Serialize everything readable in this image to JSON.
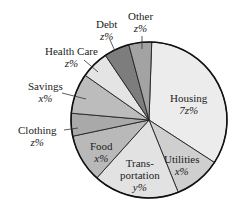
{
  "chart_data": {
    "type": "pie",
    "title": "",
    "center": [
      149,
      120
    ],
    "radius": 78,
    "slices": [
      {
        "name": "Housing",
        "label": "Housing",
        "value_label": "7z%",
        "start": 2,
        "end": 123,
        "color": "#ececec"
      },
      {
        "name": "Utilities",
        "label": "Utilities",
        "value_label": "x%",
        "start": 123,
        "end": 158,
        "color": "#cfcfcf"
      },
      {
        "name": "Transportation",
        "label": "Trans-portation",
        "value_label": "y%",
        "start": 158,
        "end": 222,
        "color": "#e2e2e2"
      },
      {
        "name": "Food",
        "label": "Food",
        "value_label": "x%",
        "start": 222,
        "end": 258,
        "color": "#b9b9b9"
      },
      {
        "name": "Clothing",
        "label": "Clothing",
        "value_label": "z%",
        "start": 258,
        "end": 275,
        "color": "#a9a9a9"
      },
      {
        "name": "Savings",
        "label": "Savings",
        "value_label": "x%",
        "start": 275,
        "end": 305,
        "color": "#bcbcbc"
      },
      {
        "name": "Health Care",
        "label": "Health Care",
        "value_label": "z%",
        "start": 305,
        "end": 326,
        "color": "#e4e4e4"
      },
      {
        "name": "Debt",
        "label": "Debt",
        "value_label": "z%",
        "start": 326,
        "end": 345,
        "color": "#7d7d7d"
      },
      {
        "name": "Other",
        "label": "Other",
        "value_label": "z%",
        "start": 345,
        "end": 362,
        "color": "#a3a3a3"
      }
    ],
    "legend": "none (labels placed on/around slices)"
  },
  "labels": {
    "housing": {
      "name": "Housing",
      "value": "7z%"
    },
    "utilities": {
      "name": "Utilities",
      "value": "x%"
    },
    "transport": {
      "line1": "Trans-",
      "line2": "portation",
      "value": "y%"
    },
    "food": {
      "name": "Food",
      "value": "x%"
    },
    "clothing": {
      "name": "Clothing",
      "value": "z%"
    },
    "savings": {
      "name": "Savings",
      "value": "x%"
    },
    "health": {
      "name": "Health Care",
      "value": "z%"
    },
    "debt": {
      "name": "Debt",
      "value": "z%"
    },
    "other": {
      "name": "Other",
      "value": "z%"
    }
  }
}
